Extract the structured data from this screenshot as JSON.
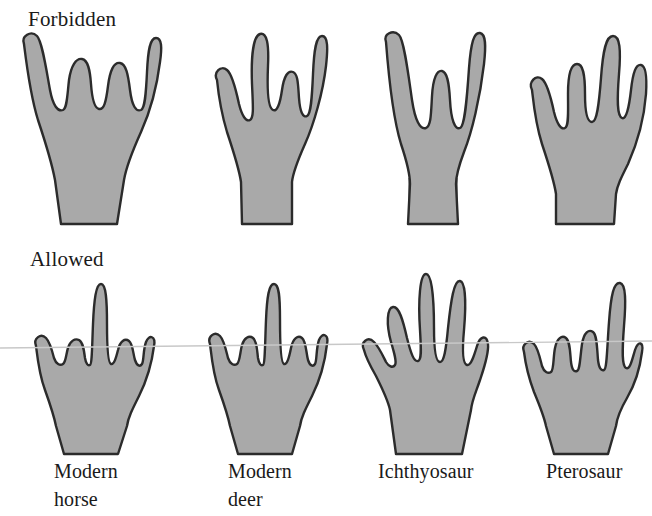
{
  "figure": {
    "caption_rows": {
      "forbidden": "Forbidden",
      "allowed": "Allowed"
    },
    "fill_color": "#a9a9a9",
    "outline_color": "#2b2b2b",
    "background_color": "#ffffff",
    "scan_line_color": "#c8c8c8"
  },
  "rows": [
    {
      "name": "forbidden",
      "label": "Forbidden",
      "specimens": [
        {
          "name": "forbidden-limb-1",
          "digits": 5,
          "caption": ""
        },
        {
          "name": "forbidden-limb-2",
          "digits": 4,
          "caption": ""
        },
        {
          "name": "forbidden-limb-3",
          "digits": 3,
          "caption": ""
        },
        {
          "name": "forbidden-limb-4",
          "digits": 5,
          "caption": ""
        }
      ]
    },
    {
      "name": "allowed",
      "label": "Allowed",
      "specimens": [
        {
          "name": "allowed-limb-horse",
          "digits": 5,
          "caption": "Modern\nhorse"
        },
        {
          "name": "allowed-limb-deer",
          "digits": 4,
          "caption": "Modern\ndeer"
        },
        {
          "name": "allowed-limb-ichthyosaur",
          "digits": 6,
          "caption": "Ichthyosaur"
        },
        {
          "name": "allowed-limb-pterosaur",
          "digits": 5,
          "caption": "Pterosaur"
        }
      ]
    }
  ],
  "labels": {
    "horse": "Modern\nhorse",
    "deer": "Modern\ndeer",
    "ichthyosaur": "Ichthyosaur",
    "pterosaur": "Pterosaur"
  }
}
